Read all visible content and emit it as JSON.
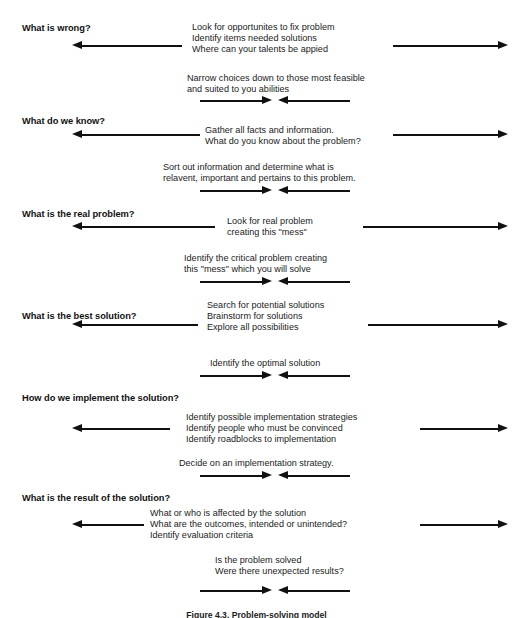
{
  "figure": {
    "caption": "Figure 4.3.  Problem-solving model",
    "ink_color": "#111111",
    "background": "#ffffff"
  },
  "stages": [
    {
      "id": "what-is-wrong",
      "question": "What is wrong?",
      "outward_lines": [
        "Look for opportunites to fix problem",
        "Identify items needed solutions",
        "Where can your talents be appied"
      ],
      "converge_lines": [
        "Narrow choices down to those most feasible",
        "and suited to you abilities"
      ]
    },
    {
      "id": "what-do-we-know",
      "question": "What do we know?",
      "outward_lines": [
        "Gather all facts and information.",
        "What do you know about the problem?"
      ],
      "converge_lines": [
        "Sort out information and determine what is",
        "relavent, important and pertains to this problem."
      ]
    },
    {
      "id": "what-is-the-real-problem",
      "question": "What is the real problem?",
      "outward_lines": [
        "Look for real problem",
        "creating this \"mess\""
      ],
      "converge_lines": [
        "Identify the critical problem creating",
        "this \"mess\" which you will solve"
      ]
    },
    {
      "id": "what-is-the-best-solution",
      "question": "What is the best solution?",
      "outward_lines": [
        "Search for potential solutions",
        "Brainstorm for solutions",
        "Explore all possibilities"
      ],
      "converge_lines": [
        "Identify the optimal solution"
      ]
    },
    {
      "id": "how-do-we-implement",
      "question": "How do we implement the solution?",
      "outward_lines": [
        "Identify possible implementation strategies",
        "Identify people who must be convinced",
        "Identify roadblocks to implementation"
      ],
      "converge_lines": [
        "Decide on an implementation strategy."
      ]
    },
    {
      "id": "what-is-the-result",
      "question": "What is the result of the solution?",
      "outward_lines": [
        "What or who is affected by the solution",
        "What are the outcomes, intended or unintended?",
        "Identify evaluation criteria"
      ],
      "converge_lines": [
        "Is the problem solved",
        "Were there unexpected results?"
      ]
    }
  ]
}
